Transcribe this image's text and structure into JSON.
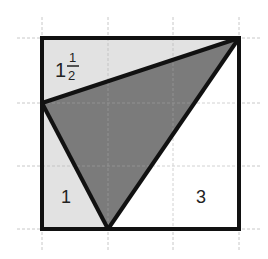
{
  "diagram": {
    "type": "square-area-puzzle",
    "grid": {
      "columns": 3,
      "rows": 3,
      "x_lines": [
        42,
        108,
        173,
        239
      ],
      "y_lines": [
        38,
        103,
        166,
        229
      ],
      "color": "#c8c8c8"
    },
    "square": {
      "corners": [
        [
          42,
          38
        ],
        [
          239,
          38
        ],
        [
          239,
          229
        ],
        [
          42,
          229
        ]
      ],
      "stroke": "#111111"
    },
    "shaded_triangle": {
      "vertices": [
        [
          42,
          103
        ],
        [
          239,
          38
        ],
        [
          108,
          229
        ]
      ],
      "fill": "#7b7b7b"
    },
    "regions": [
      {
        "id": "top-left-triangle",
        "label_whole": "1",
        "label_num": "1",
        "label_den": "2",
        "fill": "#e2e2e2"
      },
      {
        "id": "bottom-left-triangle",
        "label": "1",
        "fill": "#e2e2e2"
      },
      {
        "id": "bottom-right-triangle",
        "label": "3",
        "fill": "#ffffff"
      }
    ]
  }
}
